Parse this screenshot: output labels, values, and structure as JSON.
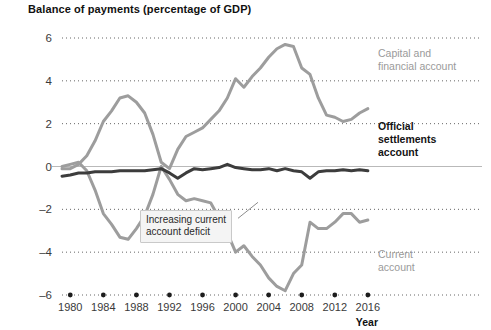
{
  "chart_data": {
    "type": "line",
    "title": "Balance of payments (percentage of GDP)",
    "xlabel": "Year",
    "ylabel": "",
    "xlim": [
      1979,
      2016.5
    ],
    "ylim": [
      -6,
      6
    ],
    "grid": true,
    "legend_position": "inline-right",
    "xticks": [
      1980,
      1984,
      1988,
      1992,
      1996,
      2000,
      2004,
      2008,
      2012,
      2016
    ],
    "yticks": [
      6,
      4,
      2,
      0,
      -2,
      -4,
      -6
    ],
    "annotations": [
      {
        "text": "Increasing current account deficit",
        "text_line1": "Increasing current",
        "text_line2": "account deficit",
        "x": 1994,
        "y": -2.7
      }
    ],
    "series": [
      {
        "name": "Capital and financial account",
        "color": "#9d9d9d",
        "label_line1": "Capital and",
        "label_line2": "financial account",
        "x": [
          1979,
          1980,
          1981,
          1982,
          1983,
          1984,
          1985,
          1986,
          1987,
          1988,
          1989,
          1990,
          1991,
          1992,
          1993,
          1994,
          1995,
          1996,
          1997,
          1998,
          1999,
          2000,
          2001,
          2002,
          2003,
          2004,
          2005,
          2006,
          2007,
          2008,
          2009,
          2010,
          2011,
          2012,
          2013,
          2014,
          2015,
          2016
        ],
        "values": [
          -0.1,
          -0.1,
          0.1,
          0.5,
          1.2,
          2.1,
          2.6,
          3.2,
          3.3,
          3.0,
          2.5,
          1.5,
          0.2,
          -0.1,
          0.8,
          1.4,
          1.6,
          1.8,
          2.2,
          2.6,
          3.2,
          4.1,
          3.7,
          4.2,
          4.6,
          5.1,
          5.5,
          5.7,
          5.6,
          4.6,
          4.3,
          3.2,
          2.4,
          2.3,
          2.1,
          2.2,
          2.5,
          2.7
        ]
      },
      {
        "name": "Current account",
        "color": "#9d9d9d",
        "label_line1": "Current",
        "label_line2": "account",
        "x": [
          1979,
          1980,
          1981,
          1982,
          1983,
          1984,
          1985,
          1986,
          1987,
          1988,
          1989,
          1990,
          1991,
          1992,
          1993,
          1994,
          1995,
          1996,
          1997,
          1998,
          1999,
          2000,
          2001,
          2002,
          2003,
          2004,
          2005,
          2006,
          2007,
          2008,
          2009,
          2010,
          2011,
          2012,
          2013,
          2014,
          2015,
          2016
        ],
        "values": [
          0.0,
          0.1,
          0.2,
          -0.2,
          -1.1,
          -2.2,
          -2.7,
          -3.3,
          -3.4,
          -2.9,
          -2.3,
          -1.3,
          0.0,
          -0.6,
          -1.3,
          -1.6,
          -1.5,
          -1.6,
          -1.7,
          -2.4,
          -3.1,
          -4.0,
          -3.7,
          -4.2,
          -4.6,
          -5.2,
          -5.6,
          -5.8,
          -5.0,
          -4.6,
          -2.6,
          -2.9,
          -2.9,
          -2.6,
          -2.2,
          -2.2,
          -2.6,
          -2.5
        ]
      },
      {
        "name": "Official settlements account",
        "color": "#3c3c3c",
        "label_line1": "Official",
        "label_line2": "settlements",
        "label_line3": "account",
        "x": [
          1979,
          1980,
          1981,
          1982,
          1983,
          1984,
          1985,
          1986,
          1987,
          1988,
          1989,
          1990,
          1991,
          1992,
          1993,
          1994,
          1995,
          1996,
          1997,
          1998,
          1999,
          2000,
          2001,
          2002,
          2003,
          2004,
          2005,
          2006,
          2007,
          2008,
          2009,
          2010,
          2011,
          2012,
          2013,
          2014,
          2015,
          2016
        ],
        "values": [
          -0.45,
          -0.4,
          -0.3,
          -0.3,
          -0.25,
          -0.25,
          -0.25,
          -0.2,
          -0.2,
          -0.2,
          -0.2,
          -0.15,
          -0.1,
          -0.3,
          -0.55,
          -0.3,
          -0.1,
          -0.15,
          -0.1,
          -0.05,
          0.1,
          -0.05,
          -0.1,
          -0.15,
          -0.15,
          -0.1,
          -0.2,
          -0.1,
          -0.2,
          -0.25,
          -0.55,
          -0.25,
          -0.2,
          -0.2,
          -0.15,
          -0.2,
          -0.15,
          -0.2
        ]
      }
    ]
  }
}
